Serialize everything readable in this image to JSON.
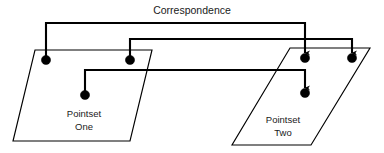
{
  "figure": {
    "title": "Correspondence",
    "background_color": "#ffffff",
    "stroke_color": "#000000",
    "text_color": "#1a1a1a"
  },
  "pointsets": [
    {
      "id": "pointset-one",
      "label_line1": "Pointset",
      "label_line2": "One",
      "label_x": 84,
      "label_y": 117,
      "shape": "parallelogram",
      "outline_points": "35,50 152,50 130,141 13,141",
      "points": [
        {
          "id": "src-point-1",
          "cx": 46,
          "cy": 60,
          "r": 4.6
        },
        {
          "id": "src-point-2",
          "cx": 130,
          "cy": 60,
          "r": 4.6
        },
        {
          "id": "src-point-3",
          "cx": 85,
          "cy": 95,
          "r": 4.6
        }
      ]
    },
    {
      "id": "pointset-two",
      "label_line1": "Pointset",
      "label_line2": "Two",
      "label_x": 283,
      "label_y": 123,
      "shape": "parallelogram",
      "outline_points": "290,48 370,48 311,145 232,145",
      "points": [
        {
          "id": "dst-point-1",
          "cx": 305,
          "cy": 58,
          "r": 4.6
        },
        {
          "id": "dst-point-2",
          "cx": 352,
          "cy": 58,
          "r": 4.6
        },
        {
          "id": "dst-point-3",
          "cx": 305,
          "cy": 93,
          "r": 4.6
        }
      ]
    }
  ],
  "correspondences": [
    {
      "id": "correspondence-1",
      "from": "src-point-1",
      "to": "dst-point-1",
      "path": "M 46 60 L 46 23 L 305 23 L 305 53",
      "arrow": true
    },
    {
      "id": "correspondence-2",
      "from": "src-point-2",
      "to": "dst-point-2",
      "path": "M 130 60 L 130 39 L 352 39 L 352 53",
      "arrow": true
    },
    {
      "id": "correspondence-3",
      "from": "src-point-3",
      "to": "dst-point-3",
      "path": "M 85 95 L 85 70 L 305 70 L 305 88",
      "arrow": true
    }
  ]
}
